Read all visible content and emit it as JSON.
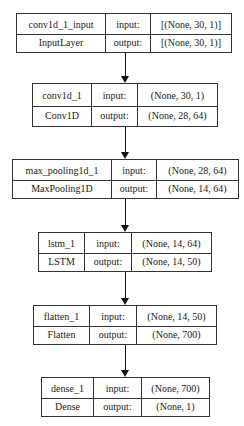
{
  "diagram": {
    "type": "keras-model-plot",
    "nodes": [
      {
        "name": "conv1d_1_input",
        "class": "InputLayer",
        "input_label": "input:",
        "output_label": "output:",
        "input_shape": "[(None, 30, 1)]",
        "output_shape": "[(None, 30, 1)]"
      },
      {
        "name": "conv1d_1",
        "class": "Conv1D",
        "input_label": "input:",
        "output_label": "output:",
        "input_shape": "(None, 30, 1)",
        "output_shape": "(None, 28, 64)"
      },
      {
        "name": "max_pooling1d_1",
        "class": "MaxPooling1D",
        "input_label": "input:",
        "output_label": "output:",
        "input_shape": "(None, 28, 64)",
        "output_shape": "(None, 14, 64)"
      },
      {
        "name": "lstm_1",
        "class": "LSTM",
        "input_label": "input:",
        "output_label": "output:",
        "input_shape": "(None, 14, 64)",
        "output_shape": "(None, 14, 50)"
      },
      {
        "name": "flatten_1",
        "class": "Flatten",
        "input_label": "input:",
        "output_label": "output:",
        "input_shape": "(None, 14, 50)",
        "output_shape": "(None, 700)"
      },
      {
        "name": "dense_1",
        "class": "Dense",
        "input_label": "input:",
        "output_label": "output:",
        "input_shape": "(None, 700)",
        "output_shape": "(None, 1)"
      }
    ],
    "edges": [
      {
        "from": "conv1d_1_input",
        "to": "conv1d_1"
      },
      {
        "from": "conv1d_1",
        "to": "max_pooling1d_1"
      },
      {
        "from": "max_pooling1d_1",
        "to": "lstm_1"
      },
      {
        "from": "lstm_1",
        "to": "flatten_1"
      },
      {
        "from": "flatten_1",
        "to": "dense_1"
      }
    ],
    "colors": {
      "border": "#333333",
      "text": "#1a1a1a",
      "background": "#ffffff"
    }
  }
}
